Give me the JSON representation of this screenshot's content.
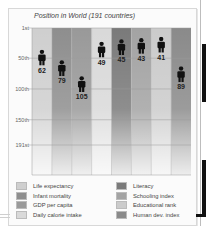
{
  "chart_data": {
    "type": "bar",
    "title": "Position in World (191 countries)",
    "xlabel": "",
    "ylabel": "",
    "y_inverted": true,
    "ylim": [
      1,
      191
    ],
    "yticks": [
      {
        "value": 1,
        "label": "1st"
      },
      {
        "value": 50,
        "label": "50th"
      },
      {
        "value": 100,
        "label": "100th"
      },
      {
        "value": 150,
        "label": "150th"
      },
      {
        "value": 191,
        "label": "191st"
      }
    ],
    "grid": true,
    "legend_position": "bottom",
    "marker": "person-icon",
    "categories": [
      "Life expectancy",
      "Infant mortality",
      "GDP per capita",
      "Daily calorie intake",
      "Literacy",
      "Schooling index",
      "Educational rank",
      "Human dev. index"
    ],
    "values": [
      62,
      79,
      105,
      49,
      45,
      43,
      41,
      89
    ],
    "colors": [
      "#cfcfcf",
      "#8e8e8e",
      "#999999",
      "#d9d9d9",
      "#7a7a7a",
      "#a3a3a3",
      "#cbcbcb",
      "#8a8a8a"
    ]
  },
  "legend": {
    "columns": [
      [
        "Life expectancy",
        "Infant mortality",
        "GDP per capita",
        "Daily calorie intake"
      ],
      [
        "Literacy",
        "Schooling index",
        "Educational rank",
        "Human dev. index"
      ]
    ]
  }
}
